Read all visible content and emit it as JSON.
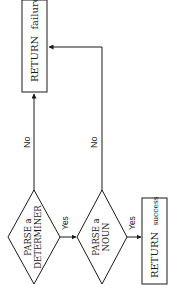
{
  "diagram": {
    "orientation": "rotated-90-ccw",
    "nodes": {
      "parse_determiner": {
        "shape": "diamond",
        "line1": "PARSE a",
        "line2": "DETERMINER"
      },
      "parse_noun": {
        "shape": "diamond",
        "line1": "PARSE a",
        "line2": "NOUN"
      },
      "return_success": {
        "shape": "rectangle",
        "word1": "RETURN",
        "word2": "success"
      },
      "return_failure": {
        "shape": "rectangle",
        "word1": "RETURN",
        "word2": "failure"
      }
    },
    "edges": {
      "det_yes": {
        "from": "parse_determiner",
        "to": "parse_noun",
        "label": "Yes"
      },
      "det_no": {
        "from": "parse_determiner",
        "to": "return_failure",
        "label": "No"
      },
      "noun_yes": {
        "from": "parse_noun",
        "to": "return_success",
        "label": "Yes"
      },
      "noun_no": {
        "from": "parse_noun",
        "to": "return_failure",
        "label": "No"
      }
    },
    "colors": {
      "stroke": "#1a1a1a",
      "background": "#ffffff"
    }
  }
}
